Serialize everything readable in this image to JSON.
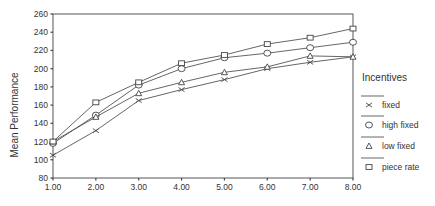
{
  "chart_data": {
    "type": "line",
    "title": "",
    "xlabel": "",
    "ylabel": "Mean Performance",
    "x": [
      1.0,
      2.0,
      3.0,
      4.0,
      5.0,
      6.0,
      7.0,
      8.0
    ],
    "x_tick_labels": [
      "1.00",
      "2.00",
      "3.00",
      "4.00",
      "5.00",
      "6.00",
      "7.00",
      "8.00"
    ],
    "y_ticks": [
      80,
      100,
      120,
      140,
      160,
      180,
      200,
      220,
      240,
      260
    ],
    "y_tick_labels": [
      "80",
      "100",
      "120",
      "140",
      "160",
      "180",
      "200",
      "220",
      "240",
      "260"
    ],
    "ylim": [
      80,
      260
    ],
    "xlim": [
      1,
      8
    ],
    "grid": false,
    "legend_position": "right",
    "legend_title": "Incentives",
    "series": [
      {
        "name": "fixed",
        "marker": "x",
        "values": [
          105,
          132,
          165,
          177,
          188,
          200,
          207,
          213
        ]
      },
      {
        "name": "high fixed",
        "marker": "circle",
        "values": [
          118,
          149,
          182,
          200,
          212,
          217,
          223,
          229
        ]
      },
      {
        "name": "low fixed",
        "marker": "triangle",
        "values": [
          120,
          147,
          173,
          185,
          196,
          202,
          214,
          213
        ]
      },
      {
        "name": "piece rate",
        "marker": "square",
        "values": [
          120,
          163,
          185,
          206,
          215,
          227,
          234,
          244
        ]
      }
    ]
  }
}
